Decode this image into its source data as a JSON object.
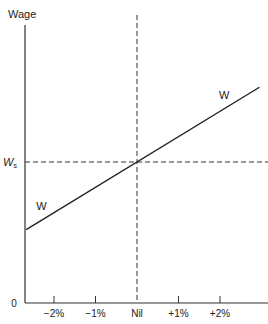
{
  "chart_data": {
    "type": "line",
    "title": "",
    "ylabel": "Wage",
    "xlabel": "",
    "origin_label": "0",
    "x_ticks": [
      {
        "value": -2,
        "label": "−2%"
      },
      {
        "value": -1,
        "label": "−1%"
      },
      {
        "value": 0,
        "label": "Nil"
      },
      {
        "value": 1,
        "label": "+1%"
      },
      {
        "value": 2,
        "label": "+2%"
      }
    ],
    "xlim": [
      -2.67,
      3.1
    ],
    "ylim": [
      0,
      1.97
    ],
    "reference_lines": {
      "vertical_at_x": 0,
      "horizontal_at_y": 1.0,
      "horizontal_label": "Wₛ",
      "style": "dashed"
    },
    "series": [
      {
        "name": "W",
        "x": [
          -2.67,
          2.95
        ],
        "y": [
          0.52,
          1.53
        ],
        "labels": [
          {
            "text": "W",
            "x": -2.3,
            "y": 0.66
          },
          {
            "text": "W",
            "x": 2.1,
            "y": 1.45
          }
        ]
      }
    ],
    "grid": false,
    "legend": "none"
  }
}
